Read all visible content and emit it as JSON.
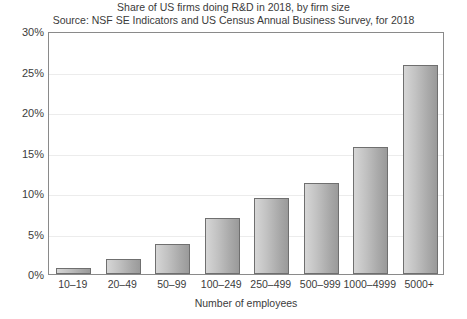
{
  "chart_data": {
    "type": "bar",
    "title": "Share of US firms doing R&D in 2018, by firm size",
    "subtitle": "Source: NSF SE Indicators and US Census Annual Business Survey, for 2018",
    "xlabel": "Number of employees",
    "ylabel": "",
    "categories": [
      "10–19",
      "20–49",
      "50–99",
      "100–249",
      "250–499",
      "500–999",
      "1000–4999",
      "5000+"
    ],
    "values": [
      0.7,
      1.8,
      3.7,
      6.9,
      9.4,
      11.2,
      15.7,
      25.8
    ],
    "value_labels": [
      "0.7%",
      "1.8%",
      "3.7%",
      "6.9%",
      "9.4%",
      "11.2%",
      "15.7%",
      "25.8%"
    ],
    "ylim": [
      0,
      30
    ],
    "ytick_values": [
      0,
      5,
      10,
      15,
      20,
      25,
      30
    ],
    "ytick_labels": [
      "0%",
      "5%",
      "10%",
      "15%",
      "20%",
      "25%",
      "30%"
    ],
    "grid": true,
    "legend": null,
    "legend_position": "none",
    "series": [
      {
        "name": "Share of firms doing R&D",
        "values": [
          0.7,
          1.8,
          3.7,
          6.9,
          9.4,
          11.2,
          15.7,
          25.8
        ]
      }
    ],
    "colors": {
      "bar_fill_light": "#d6d6d6",
      "bar_fill_dark": "#9a9a9a",
      "bar_border": "#6f6f6f",
      "gridline": "#ececec",
      "frame": "#8a8a8a",
      "text": "#3c3c3c",
      "background": "#ffffff"
    }
  }
}
